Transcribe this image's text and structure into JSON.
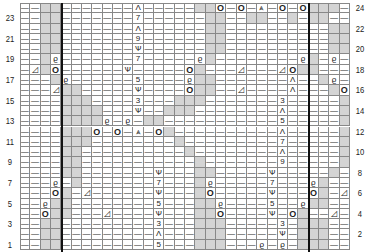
{
  "chart": {
    "columns": 32,
    "rows": 24,
    "heavy_line_after_columns": [
      3,
      27
    ],
    "colors": {
      "gray": "#d4d4d4",
      "line": "#888888",
      "heavy": "#111111"
    },
    "legend_symbols": {
      "-": "purl",
      "O": "yarn over",
      "Q": "twisted knit",
      "L": "decrease",
      "^": "increase mark",
      "V": "psso mark",
      "A": "central double decrease",
      "g": "no stitch (gray)"
    },
    "left_row_numbers": [
      "23",
      "21",
      "19",
      "17",
      "15",
      "13",
      "11",
      "9",
      "7",
      "5",
      "3",
      "1"
    ],
    "right_row_numbers": [
      "24",
      "22",
      "20",
      "18",
      "16",
      "14",
      "12",
      "10",
      "8",
      "6",
      "4",
      "2"
    ],
    "grid": [
      "--gg-------^-----ggO-O-A-O-Oggg----",
      "--gg-------7------gg--gg--g-gg----",
      "--gg-------^------gg----------gg----",
      "--gg-------9------gg----------gg----",
      "--gg-------V------gg----------gg----",
      "--gQ-------7-----Qg--------Qg-Q---",
      "-Lg|O------V-----Og---L---LOgg----",
      "---gQ------5----Qgg-------^--gQ---",
      "---Lgg-----V----Ogg--L----^---gO--",
      "----ggg----3---ggg-------3-----g--",
      "----gggg---V--ggg--------^-----g--",
      "----ggggQ-Q-gg-----------5-----g--",
      "----gggO-O-A-Og----------^-----g--",
      "----ggg--------g---------7-----g--",
      "----gg----------g--------^-----g--",
      "----gg-----------g-------9-----g--",
      "----gg-------V---gg-----V-----g--",
      "---Q-g-------7---gQ-----7---Qg--",
      "---Og-L------V---gO-----V---Og-L-",
      "--Qgg--------5---ggQ----5--Qgg--",
      "--Ogg---L----V---ggO----V-Og--L-",
      "--gg---------3---ggg-----3-ggg--",
      "--gg---------^---ggg-----V-ggg--",
      "--gg---------5---ggg---Q-Q-ggg--"
    ]
  }
}
